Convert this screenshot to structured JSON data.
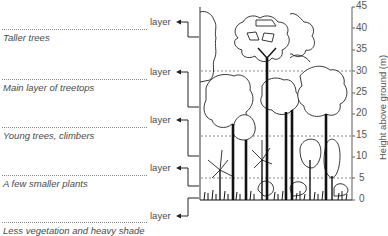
{
  "diagram": {
    "layers": [
      {
        "word": "layer",
        "description": "Taller trees",
        "range_m": [
          30,
          45
        ]
      },
      {
        "word": "layer",
        "description": "Main layer of treetops",
        "range_m": [
          15,
          30
        ]
      },
      {
        "word": "layer",
        "description": "Young trees, climbers",
        "range_m": [
          5,
          15
        ]
      },
      {
        "word": "layer",
        "description": "A few smaller plants",
        "range_m": [
          0,
          5
        ]
      },
      {
        "word": "layer",
        "description": "Less vegetation and heavy shade",
        "range_m": [
          0,
          0
        ]
      }
    ],
    "axis": {
      "label": "Height above ground (m)",
      "ticks": [
        "45",
        "40",
        "35",
        "30",
        "25",
        "20",
        "15",
        "10",
        "5",
        "0"
      ],
      "min": 0,
      "max": 45
    },
    "dotted_reference_heights_m": [
      30,
      15,
      5
    ],
    "colors": {
      "line": "#222222",
      "axis": "#777777",
      "text": "#4a4a4a",
      "dotted": "#888888"
    }
  }
}
